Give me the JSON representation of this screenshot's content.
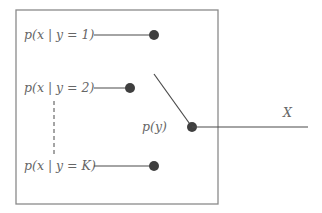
{
  "diagram": {
    "type": "mixture-model switch diagram",
    "components": [
      {
        "id": "component-1",
        "label": "p(x | y = 1)"
      },
      {
        "id": "component-2",
        "label": "p(x | y = 2)"
      },
      {
        "id": "component-k",
        "label": "p(x | y = K)"
      }
    ],
    "selector_label": "p(y)",
    "output_label": "X",
    "ellipsis": "vertical dashed line between component 2 and component K"
  }
}
